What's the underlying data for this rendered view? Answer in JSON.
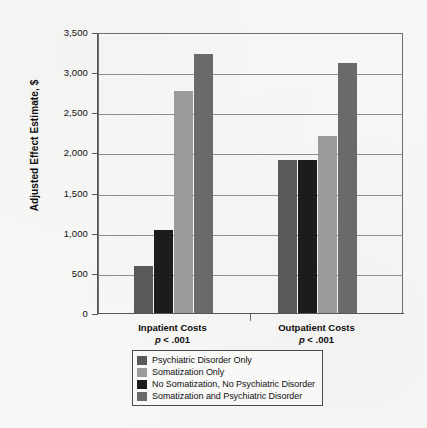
{
  "chart_data": {
    "type": "bar",
    "title": "",
    "xlabel": "",
    "ylabel": "Adjusted Effect Estimate, $",
    "ylim": [
      0,
      3500
    ],
    "ytick_step": 500,
    "ytick_labels": [
      "3,500",
      "3,000",
      "2,500",
      "2,000",
      "1,500",
      "1,000",
      "500",
      "0"
    ],
    "ytick_values": [
      3500,
      3000,
      2500,
      2000,
      1500,
      1000,
      500,
      0
    ],
    "grid": true,
    "legend_position": "bottom",
    "categories": [
      "Inpatient Costs",
      "Outpatient Costs"
    ],
    "category_annotations": [
      "p < .001",
      "p < .001"
    ],
    "series": [
      {
        "name": "Psychiatric Disorder Only",
        "color": "#595959",
        "values": [
          590,
          1900
        ]
      },
      {
        "name": "Somatization Only",
        "color": "#1c1c1c",
        "values": [
          1040,
          1910
        ]
      },
      {
        "name": "No Somatization, No Psychiatric Disorder",
        "color": "#9a9a9a",
        "values": [
          2760,
          2210
        ]
      },
      {
        "name": "Somatization and Psychiatric Disorder",
        "color": "#6a6a6a",
        "values": [
          3220,
          3110
        ]
      }
    ],
    "legend": [
      {
        "label": "Psychiatric Disorder Only",
        "color": "#595959"
      },
      {
        "label": "Somatization Only",
        "color": "#9a9a9a"
      },
      {
        "label": "No Somatization, No Psychiatric Disorder",
        "color": "#1c1c1c"
      },
      {
        "label": "Somatization and Psychiatric Disorder",
        "color": "#6a6a6a"
      }
    ]
  }
}
